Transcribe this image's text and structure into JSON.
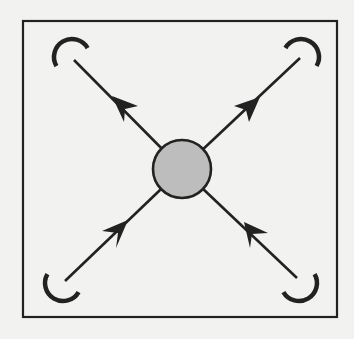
{
  "diagram": {
    "background": "#f2f2f1",
    "stroke_color": "#222222",
    "frame": {
      "x": 23,
      "y": 21,
      "width": 314,
      "height": 296,
      "stroke_width": 2.2
    },
    "center_node": {
      "cx": 182,
      "cy": 169,
      "r": 29,
      "fill": "#bdbdbd",
      "stroke_width": 2.6
    },
    "rays": [
      {
        "id": "top-left",
        "line": {
          "x1": 74,
          "y1": 60
        },
        "arrowhead": {
          "tip": [
            112,
            96
          ],
          "barb1": [
            138,
            106
          ],
          "notch": [
            125,
            109
          ],
          "barb2": [
            124,
            122
          ]
        },
        "arc": {
          "cx": 72,
          "cy": 57,
          "r": 18,
          "start_deg": 150,
          "end_deg": 330
        }
      },
      {
        "id": "top-right",
        "line": {
          "x1": 300,
          "y1": 58
        },
        "arrowhead": {
          "tip": [
            260,
            97
          ],
          "barb1": [
            234,
            106
          ],
          "notch": [
            246,
            110
          ],
          "barb2": [
            249,
            122
          ]
        },
        "arc": {
          "cx": 301,
          "cy": 57,
          "r": 18,
          "start_deg": 210,
          "end_deg": 390
        }
      },
      {
        "id": "bottom-left",
        "line": {
          "x1": 65,
          "y1": 281
        },
        "arrowhead": {
          "tip": [
            128,
            220
          ],
          "barb1": [
            102,
            231
          ],
          "notch": [
            118,
            233
          ],
          "barb2": [
            116,
            248
          ]
        },
        "arc": {
          "cx": 63,
          "cy": 283,
          "r": 18,
          "start_deg": 30,
          "end_deg": 210
        }
      },
      {
        "id": "bottom-right",
        "line": {
          "x1": 297,
          "y1": 278
        },
        "arrowhead": {
          "tip": [
            244,
            222
          ],
          "barb1": [
            268,
            233
          ],
          "notch": [
            252,
            234
          ],
          "barb2": [
            250,
            248
          ]
        },
        "arc": {
          "cx": 299,
          "cy": 283,
          "r": 18,
          "start_deg": -30,
          "end_deg": 150
        }
      }
    ]
  }
}
